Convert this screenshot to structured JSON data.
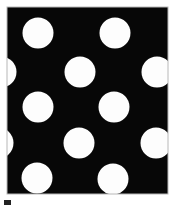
{
  "figure": {
    "title": "Hexagonal array of white circular apertures on black field",
    "label": "a",
    "width": 173,
    "height": 209,
    "background_color": "#ffffff",
    "field_color": "#070707",
    "circle_color": "#fdfdfd",
    "border_color": "#b8b8b8",
    "panel": {
      "x": 7,
      "y": 7,
      "width": 161,
      "height": 187
    },
    "marker": {
      "name": "panel-label-mark",
      "x": 4,
      "y": 200,
      "width": 7,
      "height": 5,
      "color": "#222222"
    },
    "circle_radius": 15.5,
    "circles": [
      {
        "id": "circle-r1-c1",
        "cx": 38,
        "cy": 33,
        "r": 15.5,
        "clipped": false
      },
      {
        "id": "circle-r1-c2",
        "cx": 115,
        "cy": 33,
        "r": 15.5,
        "clipped": false
      },
      {
        "id": "circle-r2-c0",
        "cx": 1,
        "cy": 72,
        "r": 15.5,
        "clipped": true
      },
      {
        "id": "circle-r2-c1",
        "cx": 80,
        "cy": 72,
        "r": 15.5,
        "clipped": false
      },
      {
        "id": "circle-r2-c2",
        "cx": 157,
        "cy": 72,
        "r": 15.5,
        "clipped": true
      },
      {
        "id": "circle-r3-c1",
        "cx": 38,
        "cy": 107,
        "r": 15.5,
        "clipped": false
      },
      {
        "id": "circle-r3-c2",
        "cx": 114,
        "cy": 107,
        "r": 15.5,
        "clipped": false
      },
      {
        "id": "circle-r4-c0",
        "cx": -2,
        "cy": 143,
        "r": 15.5,
        "clipped": true
      },
      {
        "id": "circle-r4-c1",
        "cx": 79,
        "cy": 143,
        "r": 15.5,
        "clipped": false
      },
      {
        "id": "circle-r4-c2",
        "cx": 156,
        "cy": 143,
        "r": 15.5,
        "clipped": true
      },
      {
        "id": "circle-r5-c1",
        "cx": 37,
        "cy": 178,
        "r": 15.5,
        "clipped": false
      },
      {
        "id": "circle-r5-c2",
        "cx": 113,
        "cy": 179,
        "r": 15.5,
        "clipped": false
      }
    ]
  }
}
